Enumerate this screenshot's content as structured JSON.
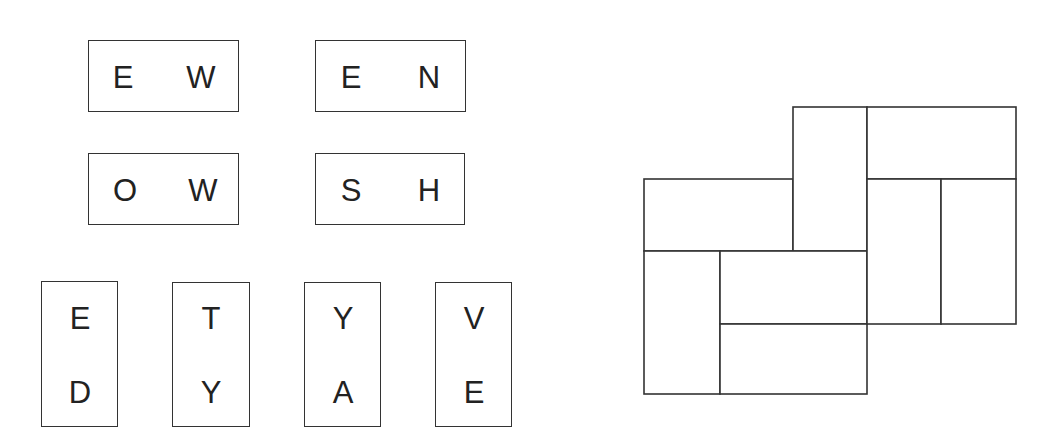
{
  "tiles": {
    "horizontal": [
      {
        "letters": [
          "E",
          "W"
        ]
      },
      {
        "letters": [
          "E",
          "N"
        ]
      },
      {
        "letters": [
          "O",
          "W"
        ]
      },
      {
        "letters": [
          "S",
          "H"
        ]
      }
    ],
    "vertical": [
      {
        "letters": [
          "E",
          "D"
        ]
      },
      {
        "letters": [
          "T",
          "Y"
        ]
      },
      {
        "letters": [
          "Y",
          "A"
        ]
      },
      {
        "letters": [
          "V",
          "E"
        ]
      }
    ]
  },
  "grid": {
    "description": "Empty domino-tiling grid of 8 cells",
    "line_color": "#333333"
  }
}
